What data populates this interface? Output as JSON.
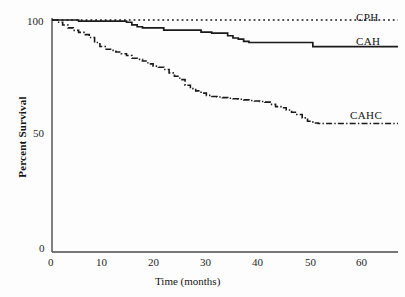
{
  "chart_data": {
    "type": "line",
    "title": "",
    "subtitle": "",
    "xlabel": "Time (months)",
    "ylabel": "Percent Survival",
    "xlim": [
      0,
      65
    ],
    "ylim": [
      0,
      103
    ],
    "grid": false,
    "legend_position": "inline-right-of-curve",
    "xticks": [
      0,
      10,
      20,
      30,
      40,
      50,
      60
    ],
    "xtick_labels": [
      "0",
      "10",
      "20",
      "30",
      "40",
      "50",
      "60"
    ],
    "yticks": [
      0,
      50,
      100
    ],
    "ytick_labels": [
      "0",
      "50",
      "100"
    ],
    "series": [
      {
        "name": "CPH",
        "label": "CPH",
        "linestyle": "dotted",
        "color": "#1a1a1a",
        "x": [
          0,
          1,
          2,
          3,
          4,
          5,
          6,
          8,
          10,
          14,
          20,
          26,
          32,
          38,
          44,
          50,
          56,
          62,
          65
        ],
        "values": [
          100,
          100,
          100,
          100,
          100,
          100,
          100,
          100,
          100,
          100,
          100,
          100,
          100,
          100,
          100,
          100,
          100,
          100,
          100
        ]
      },
      {
        "name": "CAH",
        "label": "CAH",
        "linestyle": "solid",
        "color": "#1a1a1a",
        "x": [
          0,
          1,
          2,
          3,
          4,
          5,
          8,
          11,
          13,
          14,
          15,
          16,
          17,
          18,
          20,
          21,
          22,
          24,
          26,
          28,
          29,
          30,
          31,
          32,
          33,
          34,
          35,
          36,
          37,
          40,
          44,
          48,
          49,
          55,
          60,
          65
        ],
        "values": [
          100,
          100,
          100,
          100,
          100,
          99.5,
          99.5,
          99.5,
          99.5,
          99.0,
          97.8,
          97.0,
          96.5,
          96.5,
          96.5,
          95.5,
          95.5,
          95.5,
          95.5,
          94.6,
          94.6,
          94.2,
          94.2,
          94.2,
          93.0,
          92.0,
          91.5,
          90.5,
          90.0,
          90.0,
          90.0,
          90.0,
          88.2,
          88.2,
          88.2,
          88.2
        ]
      },
      {
        "name": "CAHC",
        "label": "CAHC",
        "linestyle": "dashdot",
        "color": "#1a1a1a",
        "x": [
          0,
          1,
          2,
          3,
          4,
          5,
          6,
          7,
          8,
          9,
          10,
          11,
          12,
          13,
          14,
          15,
          16,
          17,
          18,
          19,
          20,
          21,
          22,
          23,
          24,
          25,
          26,
          27,
          28,
          29,
          30,
          31,
          32,
          33,
          34,
          35,
          36,
          37,
          38,
          39,
          40,
          41,
          42,
          43,
          44,
          45,
          46,
          47,
          48,
          49,
          50,
          54,
          58,
          62,
          65
        ],
        "values": [
          100,
          99.0,
          97.8,
          96.5,
          95.4,
          94.5,
          93.5,
          92.2,
          90.0,
          88.2,
          87.0,
          86.5,
          85.8,
          85.0,
          84.2,
          83.0,
          82.5,
          81.8,
          80.5,
          79.5,
          79.0,
          78.0,
          76.5,
          75.0,
          73.5,
          71.0,
          69.5,
          68.5,
          67.5,
          66.5,
          66.0,
          65.8,
          65.5,
          65.2,
          65.0,
          64.8,
          64.5,
          64.2,
          64.0,
          63.8,
          63.5,
          62.5,
          61.5,
          61.0,
          60.0,
          59.0,
          58.0,
          56.5,
          55.0,
          54.2,
          54.0,
          54.0,
          54.0,
          54.0,
          54.0
        ]
      }
    ],
    "annotations": [
      {
        "text": "CPH",
        "x_px": 356,
        "y_px": 16
      },
      {
        "text": "CAH",
        "x_px": 356,
        "y_px": 40
      },
      {
        "text": "CAHC",
        "x_px": 350,
        "y_px": 114
      }
    ]
  },
  "axes": {
    "x_axis_name": "time-axis",
    "y_axis_name": "percent-survival-axis"
  }
}
